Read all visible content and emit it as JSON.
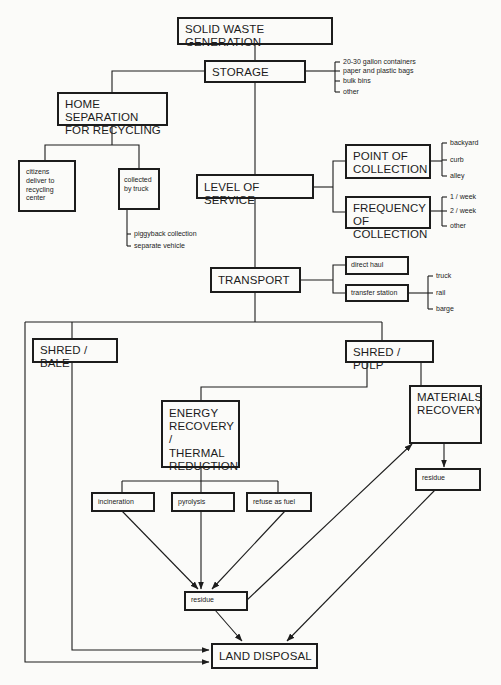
{
  "diagram": {
    "title": "SOLID WASTE GENERATION",
    "nodes": {
      "generation": "SOLID WASTE GENERATION",
      "storage": "STORAGE",
      "home_separation": "HOME SEPARATION\nFOR RECYCLING",
      "citizens_deliver": "citizens\ndeliver to\nrecycling\ncenter",
      "collected_by_truck": "collected\nby truck",
      "level_of_service": "LEVEL OF SERVICE",
      "point_of_collection": "POINT OF\nCOLLECTION",
      "frequency_of_collection": "FREQUENCY\nOF COLLECTION",
      "transport": "TRANSPORT",
      "direct_haul": "direct haul",
      "transfer_station": "transfer station",
      "shred_bale": "SHRED / BALE",
      "shred_pulp": "SHRED / PULP",
      "energy_recovery": "ENERGY\nRECOVERY /\nTHERMAL\nREDUCTION",
      "materials_recovery": "MATERIALS\nRECOVERY",
      "incineration": "incineration",
      "pyrolysis": "pyrolysis",
      "refuse_as_fuel": "refuse as fuel",
      "residue_energy": "residue",
      "residue_materials": "residue",
      "land_disposal": "LAND DISPOSAL"
    },
    "lists": {
      "storage_options": [
        "20-30 gallon containers",
        "paper and plastic bags",
        "bulk bins",
        "other"
      ],
      "truck_collection_options": [
        "piggyback collection",
        "separate vehicle"
      ],
      "collection_points": [
        "backyard",
        "curb",
        "alley"
      ],
      "collection_frequency": [
        "1 / week",
        "2 / week",
        "other"
      ],
      "transfer_modes": [
        "truck",
        "rail",
        "barge"
      ]
    },
    "edges": [
      [
        "generation",
        "storage"
      ],
      [
        "storage",
        "home_separation"
      ],
      [
        "storage",
        "level_of_service"
      ],
      [
        "home_separation",
        "citizens_deliver"
      ],
      [
        "home_separation",
        "collected_by_truck"
      ],
      [
        "level_of_service",
        "point_of_collection"
      ],
      [
        "level_of_service",
        "frequency_of_collection"
      ],
      [
        "level_of_service",
        "transport"
      ],
      [
        "transport",
        "direct_haul"
      ],
      [
        "transport",
        "transfer_station"
      ],
      [
        "transport",
        "shred_bale"
      ],
      [
        "transport",
        "shred_pulp"
      ],
      [
        "transport",
        "land_disposal"
      ],
      [
        "shred_bale",
        "land_disposal"
      ],
      [
        "shred_pulp",
        "energy_recovery"
      ],
      [
        "shred_pulp",
        "materials_recovery"
      ],
      [
        "energy_recovery",
        "incineration"
      ],
      [
        "energy_recovery",
        "pyrolysis"
      ],
      [
        "energy_recovery",
        "refuse_as_fuel"
      ],
      [
        "incineration",
        "residue_energy"
      ],
      [
        "pyrolysis",
        "residue_energy"
      ],
      [
        "refuse_as_fuel",
        "residue_energy"
      ],
      [
        "residue_energy",
        "materials_recovery"
      ],
      [
        "residue_energy",
        "land_disposal"
      ],
      [
        "materials_recovery",
        "residue_materials"
      ],
      [
        "residue_materials",
        "land_disposal"
      ]
    ],
    "line_color": "#1c1c1c",
    "background": "#fbfbf9"
  }
}
